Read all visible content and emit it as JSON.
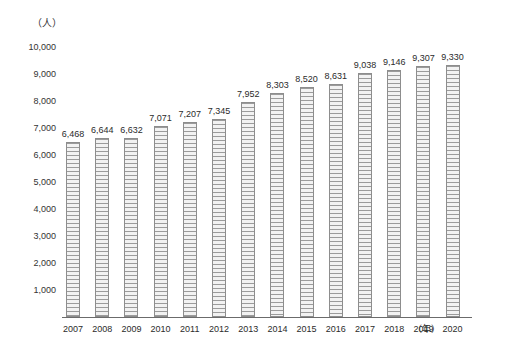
{
  "chart_data": {
    "type": "bar",
    "title": "",
    "subtitle": "",
    "xlabel": "年",
    "ylabel": "人",
    "unit_label": "（人）",
    "xaxis_unit_label": "（年）",
    "categories": [
      "2007",
      "2008",
      "2009",
      "2010",
      "2011",
      "2012",
      "2013",
      "2014",
      "2015",
      "2016",
      "2017",
      "2018",
      "2019",
      "2020"
    ],
    "values": [
      6468,
      6644,
      6632,
      7071,
      7207,
      7345,
      7952,
      8303,
      8520,
      8631,
      9038,
      9146,
      9307,
      9330
    ],
    "value_labels": [
      "6,468",
      "6,644",
      "6,632",
      "7,071",
      "7,207",
      "7,345",
      "7,952",
      "8,303",
      "8,520",
      "8,631",
      "9,038",
      "9,146",
      "9,307",
      "9,330"
    ],
    "ylim": [
      0,
      10000
    ],
    "ytick_values": [
      10000,
      9000,
      8000,
      7000,
      6000,
      5000,
      4000,
      3000,
      2000,
      1000
    ],
    "ytick_labels": [
      "10,000",
      "9,000",
      "8,000",
      "7,000",
      "6,000",
      "5,000",
      "4,000",
      "3,000",
      "2,000",
      "1,000"
    ],
    "grid": false,
    "legend": null,
    "legend_position": "none",
    "bar_fill_pattern": "horizontal-stripes",
    "bar_border_color": "#8d8d8d",
    "bar_fill_color": "#e8e8e8",
    "axis_color": "#6b6b6b",
    "text_color": "#2b2b2b",
    "background_color": "#ffffff"
  }
}
